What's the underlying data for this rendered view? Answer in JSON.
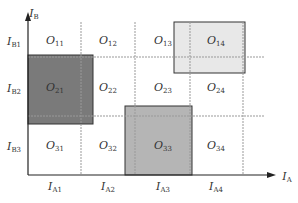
{
  "diagram": {
    "y_axis_label": {
      "main": "I",
      "sub": "B"
    },
    "x_axis_label": {
      "main": "I",
      "sub": "A"
    },
    "row_labels": [
      {
        "main": "I",
        "sub": "B1"
      },
      {
        "main": "I",
        "sub": "B2"
      },
      {
        "main": "I",
        "sub": "B3"
      }
    ],
    "col_labels": [
      {
        "main": "I",
        "sub": "A1"
      },
      {
        "main": "I",
        "sub": "A2"
      },
      {
        "main": "I",
        "sub": "A3"
      },
      {
        "main": "I",
        "sub": "A4"
      }
    ],
    "cells": [
      {
        "main": "O",
        "sub": "11"
      },
      {
        "main": "O",
        "sub": "12"
      },
      {
        "main": "O",
        "sub": "13"
      },
      {
        "main": "O",
        "sub": "14"
      },
      {
        "main": "O",
        "sub": "21"
      },
      {
        "main": "O",
        "sub": "22"
      },
      {
        "main": "O",
        "sub": "23"
      },
      {
        "main": "O",
        "sub": "24"
      },
      {
        "main": "O",
        "sub": "31"
      },
      {
        "main": "O",
        "sub": "32"
      },
      {
        "main": "O",
        "sub": "33"
      },
      {
        "main": "O",
        "sub": "34"
      }
    ],
    "shaded_regions": [
      {
        "name": "O21-region",
        "fill": "#7a7a7a"
      },
      {
        "name": "O33-region",
        "fill": "#b5b5b5"
      },
      {
        "name": "O14-region",
        "fill": "#e8e8e8"
      }
    ]
  }
}
